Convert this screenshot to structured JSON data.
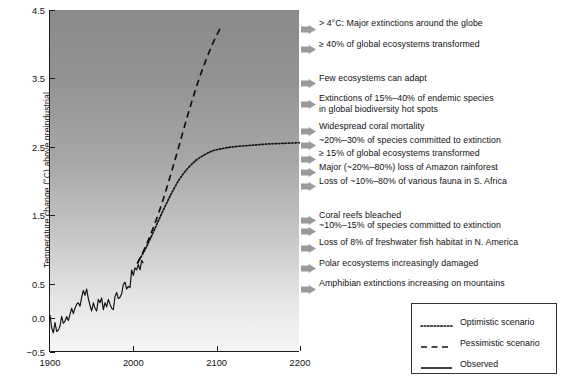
{
  "chart_data": {
    "type": "line",
    "title": "",
    "xlabel": "",
    "ylabel": "Temperature change (°C) above preindustrial",
    "xlim": [
      1900,
      2200
    ],
    "ylim": [
      -0.5,
      4.5
    ],
    "xticks": [
      "1900",
      "2000",
      "2100",
      "2200"
    ],
    "xtick_values": [
      1900,
      2000,
      2100,
      2200
    ],
    "yticks": [
      "4.5",
      "3.5",
      "2.5",
      "1.5",
      "0.5",
      "0.0",
      "−0.5"
    ],
    "ytick_values": [
      4.5,
      3.5,
      2.5,
      1.5,
      0.5,
      0.0,
      -0.5
    ],
    "grid": false,
    "legend_position": "bottom-right",
    "background": "vertical gray gradient, dark at top (hot) to white at bottom (cool)",
    "series": [
      {
        "name": "Observed",
        "style": "solid",
        "color": "#111111",
        "x": [
          1900,
          1902,
          1904,
          1906,
          1908,
          1910,
          1912,
          1914,
          1916,
          1918,
          1920,
          1922,
          1924,
          1926,
          1928,
          1930,
          1932,
          1934,
          1936,
          1938,
          1940,
          1942,
          1944,
          1946,
          1948,
          1950,
          1952,
          1954,
          1956,
          1958,
          1960,
          1962,
          1964,
          1966,
          1968,
          1970,
          1972,
          1974,
          1976,
          1978,
          1980,
          1982,
          1984,
          1986,
          1988,
          1990,
          1992,
          1994,
          1996,
          1998,
          2000,
          2002,
          2004,
          2006,
          2008,
          2010,
          2012
        ],
        "values": [
          0.04,
          -0.15,
          -0.22,
          -0.07,
          -0.2,
          -0.18,
          -0.12,
          0.02,
          -0.08,
          -0.05,
          0.02,
          -0.04,
          0.05,
          0.14,
          0.06,
          0.14,
          0.2,
          0.22,
          0.17,
          0.3,
          0.4,
          0.33,
          0.42,
          0.28,
          0.18,
          0.1,
          0.22,
          0.14,
          0.1,
          0.27,
          0.22,
          0.29,
          0.12,
          0.22,
          0.16,
          0.27,
          0.2,
          0.14,
          0.12,
          0.31,
          0.37,
          0.28,
          0.3,
          0.35,
          0.49,
          0.52,
          0.42,
          0.46,
          0.44,
          0.7,
          0.62,
          0.73,
          0.7,
          0.78,
          0.7,
          0.84,
          0.8
        ]
      },
      {
        "name": "Pessimistic scenario",
        "style": "dashed",
        "color": "#111111",
        "x": [
          2005,
          2015,
          2025,
          2035,
          2045,
          2055,
          2065,
          2075,
          2085,
          2095,
          2105
        ],
        "values": [
          0.8,
          1.05,
          1.35,
          1.7,
          2.1,
          2.52,
          2.95,
          3.35,
          3.7,
          4.0,
          4.25
        ]
      },
      {
        "name": "Optimistic scenario",
        "style": "dotted",
        "color": "#111111",
        "x": [
          2005,
          2015,
          2025,
          2035,
          2045,
          2055,
          2065,
          2075,
          2085,
          2095,
          2105,
          2120,
          2140,
          2160,
          2180,
          2200
        ],
        "values": [
          0.8,
          1.02,
          1.28,
          1.55,
          1.8,
          2.02,
          2.18,
          2.3,
          2.38,
          2.44,
          2.47,
          2.5,
          2.52,
          2.54,
          2.55,
          2.56
        ]
      }
    ],
    "impact_annotations": [
      {
        "temperature": 4.3,
        "text": "> 4°C: Major extinctions around the globe"
      },
      {
        "temperature": 4.0,
        "text": "≥ 40% of global ecosystems transformed"
      },
      {
        "temperature": 3.5,
        "text": "Few ecosystems can adapt"
      },
      {
        "temperature": 3.2,
        "text": "Extinctions of 15%–40% of endemic species\nin global biodiversity hot spots"
      },
      {
        "temperature": 2.8,
        "text": "Widespread coral mortality"
      },
      {
        "temperature": 2.6,
        "text": "~20%–30% of species committed to extinction"
      },
      {
        "temperature": 2.4,
        "text": "≥ 15% of global ecosystems transformed"
      },
      {
        "temperature": 2.2,
        "text": "Major (~20%–80%) loss of Amazon rainforest"
      },
      {
        "temperature": 2.0,
        "text": "Loss of ~10%–80% of various fauna in S. Africa"
      },
      {
        "temperature": 1.5,
        "text": "Coral reefs bleached"
      },
      {
        "temperature": 1.35,
        "text": "~10%–15% of species committed to extinction"
      },
      {
        "temperature": 1.1,
        "text": "Loss of 8% of freshwater fish habitat in N. America"
      },
      {
        "temperature": 0.8,
        "text": "Polar ecosystems increasingly damaged"
      },
      {
        "temperature": 0.5,
        "text": "Amphibian extinctions increasing on mountains"
      }
    ],
    "legend": [
      {
        "label": "Optimistic scenario",
        "style": "dotted"
      },
      {
        "label": "Pessimistic scenario",
        "style": "dashed"
      },
      {
        "label": "Observed",
        "style": "solid"
      }
    ]
  },
  "colors": {
    "axis": "#1a1a1a",
    "text": "#111111",
    "arrow": "#9a9a9a",
    "gradient_top": "#8a8a8a",
    "gradient_bottom": "#f6f6f6"
  }
}
